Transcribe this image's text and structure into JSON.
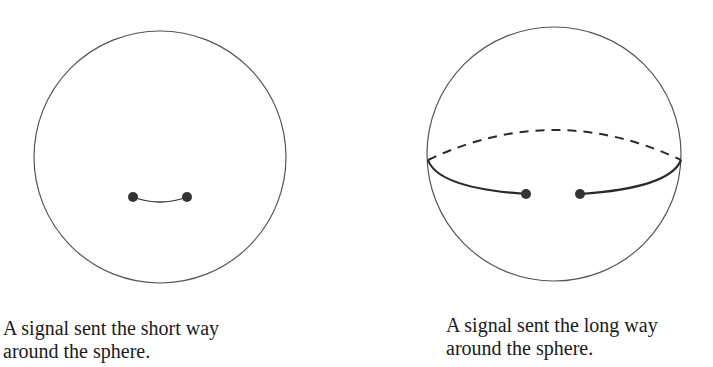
{
  "figures": [
    {
      "id": "short-way",
      "caption": {
        "line1": "A signal sent the short way",
        "line2": "around the sphere."
      }
    },
    {
      "id": "long-way",
      "caption": {
        "line1": "A signal sent the long way",
        "line2": "around the sphere."
      }
    }
  ],
  "colors": {
    "outline": "#555555",
    "path": "#2a2a2a",
    "dot": "#333333"
  }
}
